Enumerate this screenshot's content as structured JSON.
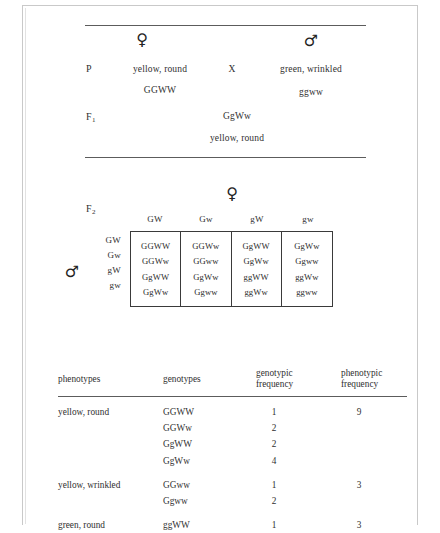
{
  "figure": {
    "symbols": {
      "female": "♀",
      "male": "♂",
      "cross": "X"
    }
  },
  "cross": {
    "p_label": "P",
    "f1_label": "F",
    "f1_sub": "1",
    "female_phenotype": "yellow, round",
    "female_genotype": "GGWW",
    "cross_sign": "X",
    "male_phenotype": "green, wrinkled",
    "male_genotype": "ggww",
    "f1_genotype": "GgWw",
    "f1_phenotype": "yellow, round"
  },
  "punnett": {
    "f2_label": "F",
    "f2_sub": "2",
    "female_symbol": "♀",
    "male_symbol": "♂",
    "col_headers": [
      "GW",
      "Gw",
      "gW",
      "gw"
    ],
    "row_headers": [
      "GW",
      "Gw",
      "gW",
      "gw"
    ],
    "cells": [
      [
        "GGWW",
        "GGWw",
        "GgWW",
        "GgWw"
      ],
      [
        "GGWw",
        "GGww",
        "GgWw",
        "Ggww"
      ],
      [
        "GgWW",
        "GgWw",
        "ggWW",
        "ggWw"
      ],
      [
        "GgWw",
        "Ggww",
        "ggWw",
        "ggww"
      ]
    ]
  },
  "freq_table": {
    "headers": {
      "phenotypes": "phenotypes",
      "genotypes": "genotypes",
      "genotypic_line1": "genotypic",
      "genotypic_line2": "frequency",
      "phenotypic_line1": "phenotypic",
      "phenotypic_line2": "frequency"
    },
    "rows": [
      {
        "phenotype": "yellow, round",
        "genotype": "GGWW",
        "genotypic_frequency": "1",
        "phenotypic_frequency": "9",
        "group_start": true
      },
      {
        "phenotype": "",
        "genotype": "GGWw",
        "genotypic_frequency": "2",
        "phenotypic_frequency": "",
        "group_start": false
      },
      {
        "phenotype": "",
        "genotype": "GgWW",
        "genotypic_frequency": "2",
        "phenotypic_frequency": "",
        "group_start": false
      },
      {
        "phenotype": "",
        "genotype": "GgWw",
        "genotypic_frequency": "4",
        "phenotypic_frequency": "",
        "group_start": false
      },
      {
        "phenotype": "yellow, wrinkled",
        "genotype": "GGww",
        "genotypic_frequency": "1",
        "phenotypic_frequency": "3",
        "group_start": true
      },
      {
        "phenotype": "",
        "genotype": "Ggww",
        "genotypic_frequency": "2",
        "phenotypic_frequency": "",
        "group_start": false
      },
      {
        "phenotype": "green, round",
        "genotype": "ggWW",
        "genotypic_frequency": "1",
        "phenotypic_frequency": "3",
        "group_start": true
      }
    ]
  }
}
